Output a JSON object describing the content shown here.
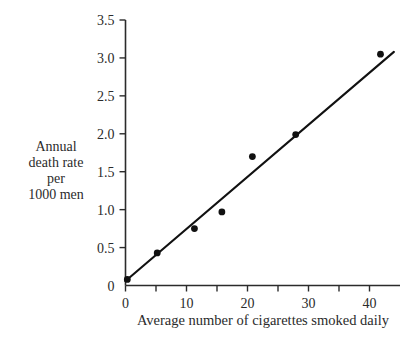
{
  "chart_data": {
    "type": "scatter",
    "title": "",
    "subtitle": "",
    "xlabel": "Average number of cigarettes smoked daily",
    "ylabel": "Annual death rate per 1000 men",
    "ylabel_lines": [
      "Annual",
      "death rate",
      "per",
      "1000 men"
    ],
    "xlim": [
      0,
      45
    ],
    "ylim": [
      0,
      3.5
    ],
    "grid": false,
    "legend": false,
    "legend_position": "none",
    "x_ticks_major": [
      0,
      10,
      20,
      30,
      40
    ],
    "x_tick_labels": [
      "0",
      "10",
      "20",
      "30",
      "40"
    ],
    "x_ticks_minor": [
      5,
      15,
      25,
      35
    ],
    "y_ticks_major": [
      0,
      0.5,
      1.0,
      1.5,
      2.0,
      2.5,
      3.0,
      3.5
    ],
    "y_tick_labels": [
      "0",
      "0.5",
      "1.0",
      "1.5",
      "2.0",
      "2.5",
      "3.0",
      "3.5"
    ],
    "points": [
      {
        "x": 0.3,
        "y": 0.08
      },
      {
        "x": 5.2,
        "y": 0.43
      },
      {
        "x": 11.3,
        "y": 0.75
      },
      {
        "x": 15.8,
        "y": 0.97
      },
      {
        "x": 20.8,
        "y": 1.7
      },
      {
        "x": 27.9,
        "y": 1.99
      },
      {
        "x": 41.8,
        "y": 3.05
      }
    ],
    "series": [
      {
        "name": "Observed death rate",
        "x": [
          0.3,
          5.2,
          11.3,
          15.8,
          20.8,
          27.9,
          41.8
        ],
        "values": [
          0.08,
          0.43,
          0.75,
          0.97,
          1.7,
          1.99,
          3.05
        ]
      }
    ],
    "fit_line": {
      "name": "Least squares regression line",
      "x_start": 0.0,
      "y_start": 0.06,
      "x_end": 44.0,
      "y_end": 3.08,
      "slope": 0.0686,
      "intercept": 0.06
    },
    "colors": {
      "point": "#111111",
      "line": "#111111",
      "axis": "#2b2b2b",
      "text": "#2b2b2b",
      "background": "#ffffff"
    }
  }
}
